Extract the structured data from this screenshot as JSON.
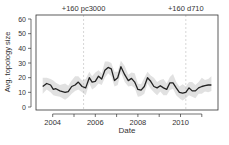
{
  "chart_data": {
    "type": "line",
    "title": "",
    "xlabel": "Date",
    "ylabel": "Avg. topology size",
    "xlim": [
      2003.2,
      2011.8
    ],
    "ylim": [
      0,
      60
    ],
    "x_ticks": [
      2004,
      2005,
      2006,
      2007,
      2008,
      2009,
      2010,
      2011
    ],
    "x_tick_labels": [
      "2004",
      "",
      "2006",
      "",
      "2008",
      "",
      "2010",
      ""
    ],
    "y_ticks": [
      0,
      10,
      20,
      30,
      40,
      50,
      60
    ],
    "y_tick_labels": [
      "0",
      "10",
      "20",
      "30",
      "40",
      "50",
      "60"
    ],
    "grid": false,
    "annotations": [
      {
        "x": 2005.45,
        "label": "+160 pc3000",
        "style": "dashed-vertical-line"
      },
      {
        "x": 2010.25,
        "label": "+160 d710",
        "style": "dashed-vertical-line"
      }
    ],
    "series": [
      {
        "name": "Avg. topology size (smoothed)",
        "color": "#222222",
        "x": [
          2003.53,
          2003.72,
          2003.9,
          2004.03,
          2004.15,
          2004.34,
          2004.58,
          2004.73,
          2004.89,
          2005.05,
          2005.2,
          2005.38,
          2005.55,
          2005.72,
          2005.85,
          2006.0,
          2006.15,
          2006.3,
          2006.45,
          2006.6,
          2006.75,
          2006.9,
          2007.05,
          2007.2,
          2007.38,
          2007.55,
          2007.7,
          2007.85,
          2008.0,
          2008.15,
          2008.3,
          2008.45,
          2008.6,
          2008.75,
          2008.9,
          2009.05,
          2009.2,
          2009.35,
          2009.5,
          2009.65,
          2009.8,
          2009.95,
          2010.1,
          2010.25,
          2010.4,
          2010.55,
          2010.7,
          2010.85,
          2011.0,
          2011.15,
          2011.3,
          2011.45
        ],
        "values": [
          14,
          16,
          15,
          12,
          12.5,
          11,
          10,
          10.5,
          14,
          15,
          17,
          14,
          13,
          20,
          17,
          17.5,
          21,
          19,
          25,
          27,
          26,
          18,
          20,
          27.5,
          22,
          18,
          19.5,
          17,
          12,
          11.5,
          14,
          20,
          17.5,
          14,
          13,
          14.5,
          13,
          12,
          16.5,
          16.5,
          13,
          10,
          9.5,
          10,
          13,
          11,
          11,
          13,
          14,
          14.5,
          15,
          15
        ]
      },
      {
        "name": "variation band",
        "color": "#d9d9d9",
        "type": "area",
        "lower_offset": -4,
        "upper_offset": 4
      }
    ]
  }
}
